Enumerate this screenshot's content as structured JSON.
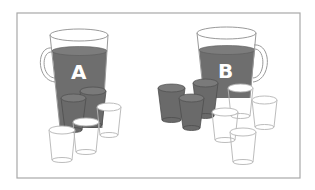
{
  "figure": {
    "colors": {
      "liquid": "#6e6e6e",
      "outline": "#9a9a9a",
      "frame": "#a8a8a8",
      "background": "#ffffff",
      "label": "#ffffff"
    },
    "pitchers": [
      {
        "label": "A",
        "filled_glasses": 2,
        "empty_glasses": 3
      },
      {
        "label": "B",
        "filled_glasses": 3,
        "empty_glasses": 5
      }
    ]
  }
}
